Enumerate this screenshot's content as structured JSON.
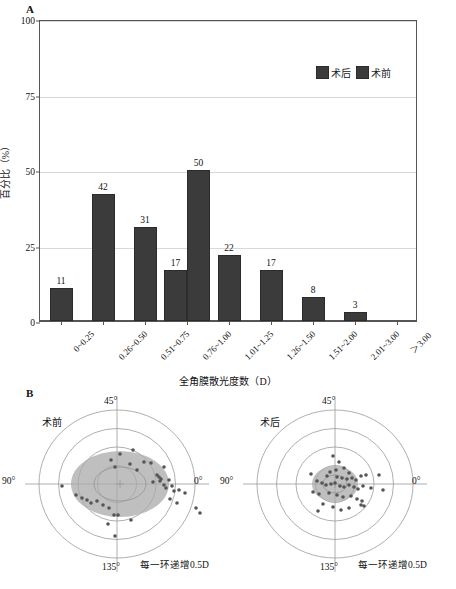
{
  "figure": {
    "panel_a_letter": "A",
    "panel_b_letter": "B"
  },
  "chart_data": [
    {
      "type": "bar",
      "title": "",
      "xlabel": "全角膜散光度数（D）",
      "ylabel": "百分比（%）",
      "ylim": [
        0,
        100
      ],
      "yticks": [
        0,
        25,
        50,
        75,
        100
      ],
      "ytick_labels": [
        "0",
        "25",
        "50",
        "75",
        "100"
      ],
      "grid": true,
      "legend_position": "top-right",
      "categories": [
        "0~0.25",
        "0.26~0.50",
        "0.51~0.75",
        "0.76~1.00",
        "1.01~1.25",
        "1.26~1.50",
        "1.51~2.00",
        "2.01~3.00",
        "＞3.00"
      ],
      "series": [
        {
          "name": "术后",
          "values": [
            11,
            42,
            31,
            17,
            22,
            17,
            8,
            3,
            null
          ]
        },
        {
          "name": "术前",
          "values": [
            null,
            null,
            null,
            50,
            null,
            null,
            null,
            null,
            null
          ]
        }
      ],
      "bars": [
        {
          "category": "0~0.25",
          "series": "术后",
          "value": 11,
          "label": "11"
        },
        {
          "category": "0.26~0.50",
          "series": "术后",
          "value": 42,
          "label": "42"
        },
        {
          "category": "0.51~0.75",
          "series": "术后",
          "value": 31,
          "label": "31"
        },
        {
          "category": "0.76~1.00",
          "series": "术后",
          "value": 17,
          "label": "17"
        },
        {
          "category": "0.76~1.00",
          "series": "术前",
          "value": 50,
          "label": "50"
        },
        {
          "category": "1.01~1.25",
          "series": "术后",
          "value": 22,
          "label": "22"
        },
        {
          "category": "1.26~1.50",
          "series": "术后",
          "value": 17,
          "label": "17"
        },
        {
          "category": "1.51~2.00",
          "series": "术后",
          "value": 8,
          "label": "8"
        },
        {
          "category": "2.01~3.00",
          "series": "术后",
          "value": 3,
          "label": "3"
        }
      ],
      "legend": [
        {
          "label": "术后",
          "color": "#3b3b3b"
        },
        {
          "label": "术前",
          "color": "#3b3b3b"
        }
      ],
      "bar_color": "#3b3b3b"
    },
    {
      "type": "scatter",
      "subtype": "polar-double-angle",
      "title": "术前",
      "note": "每一环递增0.5D",
      "angle_labels": [
        "45°",
        "90°",
        "0°",
        "135°"
      ],
      "rings": 4,
      "ring_step_D": 0.5,
      "ellipse_color": "#a9a9a9",
      "point_color": "#555555",
      "points": [
        {
          "x": 16,
          "y": -34
        },
        {
          "x": 3,
          "y": -30
        },
        {
          "x": -6,
          "y": -24
        },
        {
          "x": 13,
          "y": -20
        },
        {
          "x": 27,
          "y": -22
        },
        {
          "x": 34,
          "y": -21
        },
        {
          "x": -2,
          "y": -17
        },
        {
          "x": 20,
          "y": -14
        },
        {
          "x": 47,
          "y": -17
        },
        {
          "x": 40,
          "y": -9
        },
        {
          "x": 42,
          "y": -7
        },
        {
          "x": 44,
          "y": -5
        },
        {
          "x": 43,
          "y": -3
        },
        {
          "x": 36,
          "y": -2
        },
        {
          "x": 52,
          "y": -4
        },
        {
          "x": 47,
          "y": 1
        },
        {
          "x": 49,
          "y": 4
        },
        {
          "x": 55,
          "y": 2
        },
        {
          "x": 57,
          "y": 7
        },
        {
          "x": 62,
          "y": 6
        },
        {
          "x": 68,
          "y": 9
        },
        {
          "x": -55,
          "y": 2
        },
        {
          "x": -41,
          "y": 11
        },
        {
          "x": -35,
          "y": 14
        },
        {
          "x": -30,
          "y": 16
        },
        {
          "x": -26,
          "y": 19
        },
        {
          "x": -20,
          "y": 17
        },
        {
          "x": -14,
          "y": 21
        },
        {
          "x": -8,
          "y": 24
        },
        {
          "x": 53,
          "y": 15
        },
        {
          "x": 60,
          "y": 19
        },
        {
          "x": -3,
          "y": 31
        },
        {
          "x": 1,
          "y": 31
        },
        {
          "x": 14,
          "y": 36
        },
        {
          "x": -9,
          "y": 40
        },
        {
          "x": -2,
          "y": 52
        },
        {
          "x": 79,
          "y": 24
        },
        {
          "x": 83,
          "y": 29
        }
      ]
    },
    {
      "type": "scatter",
      "subtype": "polar-double-angle",
      "title": "术后",
      "note": "每一环递增0.5D",
      "angle_labels": [
        "45°",
        "90°",
        "0°",
        "135°"
      ],
      "rings": 4,
      "ring_step_D": 0.5,
      "ellipse_color": "#a9a9a9",
      "point_color": "#555555",
      "points": [
        {
          "x": -2,
          "y": -28
        },
        {
          "x": 4,
          "y": -22
        },
        {
          "x": 9,
          "y": -16
        },
        {
          "x": 1,
          "y": -14
        },
        {
          "x": -5,
          "y": -12
        },
        {
          "x": 14,
          "y": -11
        },
        {
          "x": -24,
          "y": -10
        },
        {
          "x": -8,
          "y": -8
        },
        {
          "x": 2,
          "y": -7
        },
        {
          "x": 7,
          "y": -6
        },
        {
          "x": 12,
          "y": -5
        },
        {
          "x": 17,
          "y": -6
        },
        {
          "x": 21,
          "y": -4
        },
        {
          "x": 26,
          "y": -8
        },
        {
          "x": 31,
          "y": -9
        },
        {
          "x": -18,
          "y": -3
        },
        {
          "x": -13,
          "y": -1
        },
        {
          "x": -9,
          "y": 1
        },
        {
          "x": -4,
          "y": 0
        },
        {
          "x": 0,
          "y": -1
        },
        {
          "x": 5,
          "y": 2
        },
        {
          "x": 9,
          "y": 3
        },
        {
          "x": 14,
          "y": 1
        },
        {
          "x": 19,
          "y": 3
        },
        {
          "x": 23,
          "y": 5
        },
        {
          "x": 28,
          "y": 2
        },
        {
          "x": 36,
          "y": 4
        },
        {
          "x": -22,
          "y": 8
        },
        {
          "x": -16,
          "y": 10
        },
        {
          "x": -6,
          "y": 9
        },
        {
          "x": 2,
          "y": 11
        },
        {
          "x": 8,
          "y": 13
        },
        {
          "x": 16,
          "y": 12
        },
        {
          "x": 22,
          "y": 15
        },
        {
          "x": 27,
          "y": 17
        },
        {
          "x": 26,
          "y": 21
        },
        {
          "x": 29,
          "y": 22
        },
        {
          "x": -12,
          "y": 20
        },
        {
          "x": -2,
          "y": 23
        },
        {
          "x": 6,
          "y": 26
        },
        {
          "x": 14,
          "y": 24
        },
        {
          "x": -17,
          "y": 27
        },
        {
          "x": 44,
          "y": -9
        },
        {
          "x": 48,
          "y": 6
        }
      ]
    }
  ]
}
